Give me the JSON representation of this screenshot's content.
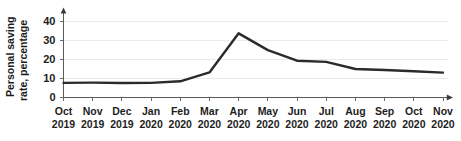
{
  "chart_data": {
    "type": "line",
    "title": "",
    "subtitle": "",
    "xlabel": "",
    "ylabel": "Personal saving rate, percentage",
    "ylabel_line1": "Personal saving",
    "ylabel_line2": "rate, percentage",
    "categories": [
      "Oct 2019",
      "Nov 2019",
      "Dec 2019",
      "Jan 2020",
      "Feb 2020",
      "Mar 2020",
      "Apr 2020",
      "May 2020",
      "Jun 2020",
      "Jul 2020",
      "Aug 2020",
      "Sep 2020",
      "Oct 2020",
      "Nov 2020"
    ],
    "category_months": [
      "Oct",
      "Nov",
      "Dec",
      "Jan",
      "Feb",
      "Mar",
      "Apr",
      "May",
      "Jun",
      "Jul",
      "Aug",
      "Sep",
      "Oct",
      "Nov"
    ],
    "category_years": [
      "2019",
      "2019",
      "2019",
      "2020",
      "2020",
      "2020",
      "2020",
      "2020",
      "2020",
      "2020",
      "2020",
      "2020",
      "2020",
      "2020"
    ],
    "values": [
      7.5,
      7.6,
      7.4,
      7.5,
      8.3,
      13.0,
      33.7,
      24.8,
      19.2,
      18.6,
      14.8,
      14.3,
      13.6,
      12.9
    ],
    "series": [
      {
        "name": "Personal saving rate",
        "color": "#2b2b2b",
        "values": [
          7.5,
          7.6,
          7.4,
          7.5,
          8.3,
          13.0,
          33.7,
          24.8,
          19.2,
          18.6,
          14.8,
          14.3,
          13.6,
          12.9
        ]
      }
    ],
    "yticks": [
      0,
      10,
      20,
      30,
      40
    ],
    "ytick_labels": [
      "0",
      "10",
      "20",
      "30",
      "40"
    ],
    "ylim": [
      0,
      45
    ],
    "xlim": [
      0,
      13
    ],
    "grid": true,
    "grid_axis": "y",
    "legend": false,
    "legend_position": "none",
    "annotations": [],
    "axis_arrows": true,
    "line_color": "#2b2b2b",
    "grid_color": "#eceaea",
    "axis_color": "#5a5a5a",
    "text_color": "#1d1d1d"
  }
}
